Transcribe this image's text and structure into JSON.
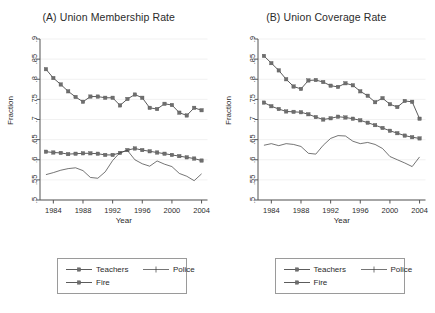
{
  "figure": {
    "width": 435,
    "height": 313,
    "background": "#ffffff",
    "series_color": "#6e6e6e",
    "line_color": "#4a4a4a",
    "police_color": "#3a3a3a",
    "axis_color": "#555555",
    "grid_color": "#eeeeee"
  },
  "legend": {
    "items": [
      {
        "key": "teachers",
        "label": "Teachers",
        "style": "line-square"
      },
      {
        "key": "police",
        "label": "Police",
        "style": "line-tick"
      },
      {
        "key": "fire",
        "label": "Fire",
        "style": "line-square"
      }
    ]
  },
  "chart_data": [
    {
      "type": "line",
      "panel": "A",
      "title": "(A) Union Membership Rate",
      "xlabel": "Year",
      "ylabel": "Fraction",
      "xlim": [
        1982.2,
        2004.8
      ],
      "ylim": [
        0.5,
        0.9
      ],
      "grid": true,
      "legend_position": "below",
      "xticks": [
        1984,
        1988,
        1992,
        1996,
        2000,
        2004
      ],
      "yticks": [
        0.5,
        0.55,
        0.6,
        0.65,
        0.7,
        0.75,
        0.8,
        0.85,
        0.9
      ],
      "ytick_labels": [
        ".5",
        ".55",
        ".6",
        ".65",
        ".7",
        ".75",
        ".8",
        ".85",
        ".9"
      ],
      "x": [
        1983,
        1984,
        1985,
        1986,
        1987,
        1988,
        1989,
        1990,
        1991,
        1992,
        1993,
        1994,
        1995,
        1996,
        1997,
        1998,
        1999,
        2000,
        2001,
        2002,
        2003,
        2004
      ],
      "series": [
        {
          "name": "Fire",
          "marker": "square",
          "values": [
            0.825,
            0.803,
            0.787,
            0.77,
            0.756,
            0.744,
            0.757,
            0.757,
            0.754,
            0.754,
            0.735,
            0.751,
            0.762,
            0.754,
            0.729,
            0.726,
            0.739,
            0.736,
            0.717,
            0.71,
            0.729,
            0.723,
            0.707,
            0.683
          ]
        },
        {
          "name": "Teachers",
          "marker": "square",
          "values": [
            0.62,
            0.618,
            0.617,
            0.614,
            0.615,
            0.616,
            0.616,
            0.615,
            0.612,
            0.612,
            0.617,
            0.624,
            0.628,
            0.624,
            0.621,
            0.618,
            0.615,
            0.612,
            0.609,
            0.606,
            0.603,
            0.598
          ]
        },
        {
          "name": "Police",
          "marker": "none",
          "values": [
            0.563,
            0.568,
            0.574,
            0.578,
            0.58,
            0.573,
            0.556,
            0.554,
            0.57,
            0.598,
            0.618,
            0.623,
            0.6,
            0.59,
            0.584,
            0.597,
            0.589,
            0.583,
            0.566,
            0.559,
            0.548,
            0.565
          ]
        }
      ]
    },
    {
      "type": "line",
      "panel": "B",
      "title": "(B) Union Coverage Rate",
      "xlabel": "Year",
      "ylabel": "Fraction",
      "xlim": [
        1982.2,
        2004.8
      ],
      "ylim": [
        0.5,
        0.9
      ],
      "grid": true,
      "legend_position": "below",
      "xticks": [
        1984,
        1988,
        1992,
        1996,
        2000,
        2004
      ],
      "yticks": [
        0.5,
        0.55,
        0.6,
        0.65,
        0.7,
        0.75,
        0.8,
        0.85,
        0.9
      ],
      "ytick_labels": [
        ".5",
        ".55",
        ".6",
        ".65",
        ".7",
        ".75",
        ".8",
        ".85",
        ".9"
      ],
      "x": [
        1983,
        1984,
        1985,
        1986,
        1987,
        1988,
        1989,
        1990,
        1991,
        1992,
        1993,
        1994,
        1995,
        1996,
        1997,
        1998,
        1999,
        2000,
        2001,
        2002,
        2003,
        2004
      ],
      "series": [
        {
          "name": "Fire",
          "marker": "square",
          "values": [
            0.858,
            0.84,
            0.822,
            0.8,
            0.782,
            0.776,
            0.797,
            0.798,
            0.793,
            0.784,
            0.781,
            0.79,
            0.785,
            0.77,
            0.759,
            0.743,
            0.753,
            0.738,
            0.731,
            0.746,
            0.744,
            0.702
          ]
        },
        {
          "name": "Teachers",
          "marker": "square",
          "values": [
            0.742,
            0.733,
            0.726,
            0.72,
            0.719,
            0.718,
            0.713,
            0.706,
            0.7,
            0.703,
            0.707,
            0.705,
            0.702,
            0.698,
            0.692,
            0.686,
            0.679,
            0.672,
            0.666,
            0.66,
            0.656,
            0.653
          ]
        },
        {
          "name": "Police",
          "marker": "none",
          "values": [
            0.636,
            0.64,
            0.635,
            0.64,
            0.638,
            0.633,
            0.616,
            0.614,
            0.636,
            0.653,
            0.66,
            0.659,
            0.646,
            0.64,
            0.643,
            0.638,
            0.628,
            0.608,
            0.6,
            0.592,
            0.583,
            0.607
          ]
        }
      ]
    }
  ]
}
